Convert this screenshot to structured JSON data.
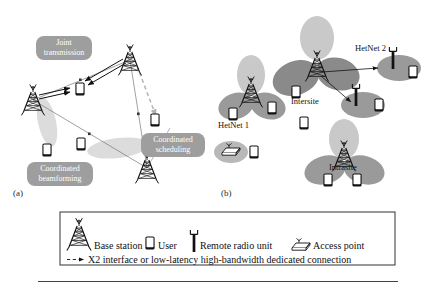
{
  "figure": {
    "panels": [
      {
        "id": "a",
        "caption": "(a)"
      },
      {
        "id": "b",
        "caption": "(b)"
      }
    ]
  },
  "panel_a": {
    "labels": [
      {
        "name": "joint-transmission",
        "line1": "Joint",
        "line2": "transmission"
      },
      {
        "name": "coordinated-beamforming",
        "line1": "Coordinated",
        "line2": "beamforming"
      },
      {
        "name": "coordinated-scheduling",
        "line1": "Coordinated",
        "line2": "scheduling"
      }
    ]
  },
  "panel_b": {
    "labels": [
      {
        "name": "hetnet-1",
        "text": "HetNet 1"
      },
      {
        "name": "hetnet-2",
        "text": "HetNet 2"
      },
      {
        "name": "intersite",
        "text": "Intersite"
      },
      {
        "name": "intrasite",
        "text": "Intrasite"
      }
    ]
  },
  "legend": {
    "items": [
      {
        "icon": "base-station-icon",
        "label": "Base station"
      },
      {
        "icon": "user-device-icon",
        "label": "User"
      },
      {
        "icon": "remote-radio-unit-icon",
        "label": "Remote radio unit"
      },
      {
        "icon": "access-point-icon",
        "label": "Access point"
      }
    ],
    "connection_note": {
      "icon": "dashed-arrow-icon",
      "label": "X2 interface or low-latency high-bandwidth dedicated connection"
    }
  },
  "colors": {
    "lobe_light": "#c9c9c9",
    "lobe_dark": "#8f8f8f",
    "lobe_mid": "#b3b3b3",
    "label_pill": "#9e9e9e",
    "ink": "#111111",
    "line": "#555555",
    "dashed": "#9a9a9a"
  }
}
